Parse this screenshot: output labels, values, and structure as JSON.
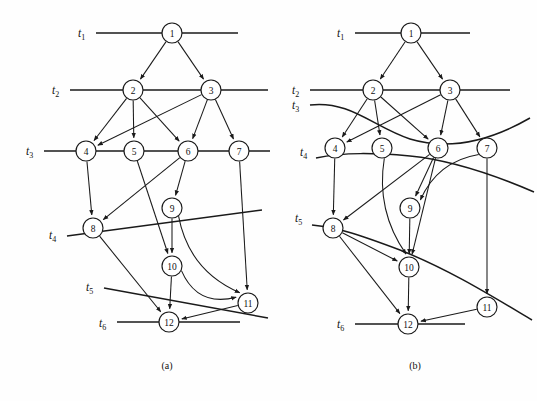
{
  "figure": {
    "caption_a": "(a)",
    "caption_b": "(b)",
    "background_color": "#fefefe",
    "ink_color": "#1a1a1a"
  },
  "diagram_a": {
    "name": "task-graph-a",
    "caption": "(a)",
    "time_labels": [
      {
        "id": "t1",
        "base": "t",
        "sub": "1",
        "x": 78,
        "y": 37
      },
      {
        "id": "t2",
        "base": "t",
        "sub": "2",
        "x": 52,
        "y": 94
      },
      {
        "id": "t3",
        "base": "t",
        "sub": "3",
        "x": 26,
        "y": 155
      },
      {
        "id": "t4",
        "base": "t",
        "sub": "4",
        "x": 49,
        "y": 239
      },
      {
        "id": "t5",
        "base": "t",
        "sub": "5",
        "x": 86,
        "y": 291
      },
      {
        "id": "t6",
        "base": "t",
        "sub": "6",
        "x": 99,
        "y": 327
      }
    ],
    "time_lines": [
      {
        "id": "t1-line",
        "x1": 96,
        "y1": 33,
        "x2": 238,
        "y2": 33
      },
      {
        "id": "t2-line",
        "x1": 70,
        "y1": 90,
        "x2": 268,
        "y2": 90
      },
      {
        "id": "t3-line",
        "x1": 44,
        "y1": 151,
        "x2": 270,
        "y2": 151
      },
      {
        "id": "t4-line",
        "x1": 67,
        "y1": 236,
        "x2": 262,
        "y2": 210
      },
      {
        "id": "t5-line",
        "x1": 104,
        "y1": 288,
        "x2": 268,
        "y2": 318
      },
      {
        "id": "t6-line",
        "x1": 117,
        "y1": 322,
        "x2": 240,
        "y2": 322
      }
    ],
    "nodes": [
      {
        "id": "1",
        "label": "1",
        "x": 172,
        "y": 33,
        "r": 10
      },
      {
        "id": "2",
        "label": "2",
        "x": 133,
        "y": 90,
        "r": 10
      },
      {
        "id": "3",
        "label": "3",
        "x": 211,
        "y": 90,
        "r": 10
      },
      {
        "id": "4",
        "label": "4",
        "x": 86,
        "y": 151,
        "r": 10
      },
      {
        "id": "5",
        "label": "5",
        "x": 134,
        "y": 151,
        "r": 10
      },
      {
        "id": "6",
        "label": "6",
        "x": 188,
        "y": 151,
        "r": 10
      },
      {
        "id": "7",
        "label": "7",
        "x": 239,
        "y": 151,
        "r": 10
      },
      {
        "id": "8",
        "label": "8",
        "x": 93,
        "y": 228,
        "r": 10
      },
      {
        "id": "9",
        "label": "9",
        "x": 172,
        "y": 208,
        "r": 10
      },
      {
        "id": "10",
        "label": "10",
        "x": 172,
        "y": 266,
        "r": 10
      },
      {
        "id": "11",
        "label": "11",
        "x": 248,
        "y": 303,
        "r": 10
      },
      {
        "id": "12",
        "label": "12",
        "x": 169,
        "y": 322,
        "r": 10
      }
    ],
    "edges": [
      {
        "from": "1",
        "to": "2"
      },
      {
        "from": "1",
        "to": "3"
      },
      {
        "from": "2",
        "to": "4"
      },
      {
        "from": "2",
        "to": "5"
      },
      {
        "from": "2",
        "to": "6"
      },
      {
        "from": "3",
        "to": "4"
      },
      {
        "from": "3",
        "to": "6"
      },
      {
        "from": "3",
        "to": "7"
      },
      {
        "from": "4",
        "to": "8"
      },
      {
        "from": "5",
        "to": "10"
      },
      {
        "from": "6",
        "to": "8"
      },
      {
        "from": "6",
        "to": "9"
      },
      {
        "from": "7",
        "to": "11"
      },
      {
        "from": "9",
        "to": "10"
      },
      {
        "from": "10",
        "to": "12"
      },
      {
        "from": "8",
        "to": "12"
      },
      {
        "from": "11",
        "to": "12"
      }
    ],
    "curved_edges": [
      {
        "id": "edge-9-11",
        "from": "9",
        "to": "11"
      },
      {
        "id": "edge-10-11",
        "from": "10",
        "to": "11"
      }
    ]
  },
  "diagram_b": {
    "name": "task-graph-b",
    "caption": "(b)",
    "time_labels": [
      {
        "id": "t1",
        "base": "t",
        "sub": "1",
        "x": 337,
        "y": 37
      },
      {
        "id": "t2",
        "base": "t",
        "sub": "2",
        "x": 292,
        "y": 94
      },
      {
        "id": "t3",
        "base": "t",
        "sub": "3",
        "x": 292,
        "y": 109
      },
      {
        "id": "t4",
        "base": "t",
        "sub": "4",
        "x": 300,
        "y": 156
      },
      {
        "id": "t5",
        "base": "t",
        "sub": "5",
        "x": 295,
        "y": 222
      },
      {
        "id": "t6",
        "base": "t",
        "sub": "6",
        "x": 337,
        "y": 328
      }
    ],
    "time_lines": [
      {
        "id": "t1-line",
        "x1": 355,
        "y1": 33,
        "x2": 470,
        "y2": 33
      },
      {
        "id": "t2-line",
        "x1": 310,
        "y1": 90,
        "x2": 510,
        "y2": 90
      }
    ],
    "time_curves": [
      {
        "id": "t3-curve",
        "d": "M 310 105 C 350 100 375 128 410 139 C 450 151 490 141 530 118"
      },
      {
        "id": "t4-curve",
        "d": "M 316 158 C 345 152 375 153 410 156 C 450 160 490 173 534 192"
      },
      {
        "id": "t5-curve",
        "d": "M 312 225 C 340 228 360 235 400 250 C 450 270 490 295 532 320"
      }
    ],
    "time_line_t6": {
      "id": "t6-line",
      "x1": 355,
      "y1": 324,
      "x2": 465,
      "y2": 324
    },
    "nodes": [
      {
        "id": "1",
        "label": "1",
        "x": 411,
        "y": 33,
        "r": 10
      },
      {
        "id": "2",
        "label": "2",
        "x": 373,
        "y": 90,
        "r": 10
      },
      {
        "id": "3",
        "label": "3",
        "x": 450,
        "y": 90,
        "r": 10
      },
      {
        "id": "4",
        "label": "4",
        "x": 335,
        "y": 148,
        "r": 10
      },
      {
        "id": "5",
        "label": "5",
        "x": 382,
        "y": 148,
        "r": 10
      },
      {
        "id": "6",
        "label": "6",
        "x": 438,
        "y": 148,
        "r": 10
      },
      {
        "id": "7",
        "label": "7",
        "x": 487,
        "y": 148,
        "r": 10
      },
      {
        "id": "8",
        "label": "8",
        "x": 333,
        "y": 228,
        "r": 10
      },
      {
        "id": "9",
        "label": "9",
        "x": 410,
        "y": 208,
        "r": 10
      },
      {
        "id": "10",
        "label": "10",
        "x": 409,
        "y": 267,
        "r": 10
      },
      {
        "id": "11",
        "label": "11",
        "x": 487,
        "y": 307,
        "r": 10
      },
      {
        "id": "12",
        "label": "12",
        "x": 408,
        "y": 324,
        "r": 10
      }
    ],
    "edges": [
      {
        "from": "1",
        "to": "2"
      },
      {
        "from": "1",
        "to": "3"
      },
      {
        "from": "2",
        "to": "4"
      },
      {
        "from": "2",
        "to": "5"
      },
      {
        "from": "2",
        "to": "6"
      },
      {
        "from": "3",
        "to": "4"
      },
      {
        "from": "3",
        "to": "6"
      },
      {
        "from": "3",
        "to": "7"
      },
      {
        "from": "4",
        "to": "8"
      },
      {
        "from": "5",
        "to": "10"
      },
      {
        "from": "6",
        "to": "8"
      },
      {
        "from": "6",
        "to": "9"
      },
      {
        "from": "6",
        "to": "10"
      },
      {
        "from": "7",
        "to": "11"
      },
      {
        "from": "9",
        "to": "10"
      },
      {
        "from": "8",
        "to": "10"
      },
      {
        "from": "8",
        "to": "12"
      },
      {
        "from": "10",
        "to": "12"
      },
      {
        "from": "11",
        "to": "12"
      }
    ],
    "curved_edges": [
      {
        "id": "edge-5-10",
        "from": "5",
        "to": "10"
      },
      {
        "id": "edge-7-9",
        "from": "7",
        "to": "9"
      }
    ]
  }
}
